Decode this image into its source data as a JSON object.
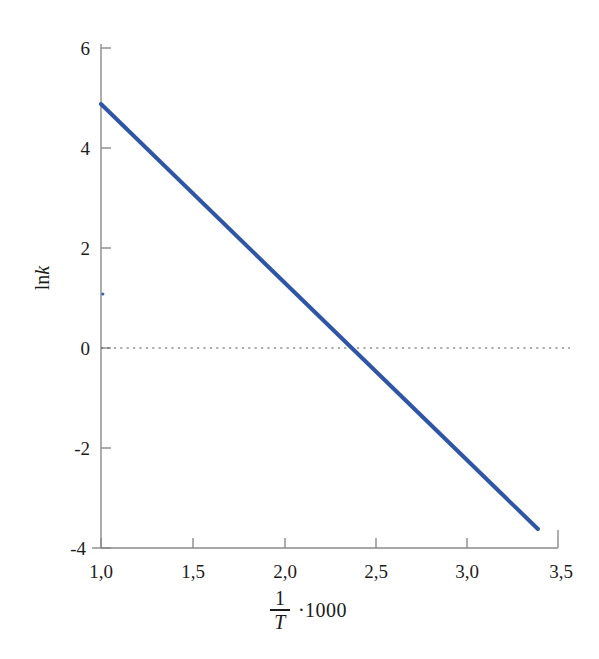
{
  "chart_data": {
    "type": "line",
    "title": "",
    "subtitle": "",
    "xlabel": "1/T ·1000",
    "ylabel": "ln k",
    "xlabel_parts": {
      "numerator": "1",
      "denominator": "T",
      "factor": "·1000"
    },
    "ylabel_parts": {
      "prefix": "ln",
      "variable": "k"
    },
    "xlim": [
      1.0,
      3.5
    ],
    "ylim": [
      -4,
      6
    ],
    "xticks": [
      1.0,
      1.5,
      2.0,
      2.5,
      3.0,
      3.5
    ],
    "xtick_labels": [
      "1,0",
      "1,5",
      "2,0",
      "2,5",
      "3,0",
      "3,5"
    ],
    "yticks": [
      6,
      4,
      2,
      0,
      -2,
      -4
    ],
    "ytick_labels": [
      "6",
      "4",
      "2",
      "0",
      "-2",
      "-4"
    ],
    "grid": false,
    "legend": "none",
    "decimal_separator": ",",
    "series": [
      {
        "name": "ln k vs 1000/T",
        "color": "#2f56a6",
        "style": "solid",
        "linewidth": 4,
        "x": [
          1.0,
          3.39
        ],
        "values": [
          4.88,
          -3.62
        ],
        "slope": -3.556,
        "intercept": 8.436,
        "x_intercept": 2.372,
        "points": [
          {
            "x": 1.0,
            "y": 4.88
          },
          {
            "x": 1.5,
            "y": 3.1
          },
          {
            "x": 2.0,
            "y": 1.32
          },
          {
            "x": 2.372,
            "y": 0.0
          },
          {
            "x": 2.5,
            "y": -0.45
          },
          {
            "x": 3.0,
            "y": -2.23
          },
          {
            "x": 3.39,
            "y": -3.62
          }
        ]
      }
    ],
    "annotations": [
      {
        "type": "reference-line",
        "name": "zero-line",
        "orientation": "horizontal",
        "value": 0,
        "style": "dotted",
        "color": "#5a5a5a"
      },
      {
        "type": "marker",
        "name": "stray-point",
        "x": 1.01,
        "y": 1.08,
        "color": "#3a5fae"
      }
    ]
  }
}
